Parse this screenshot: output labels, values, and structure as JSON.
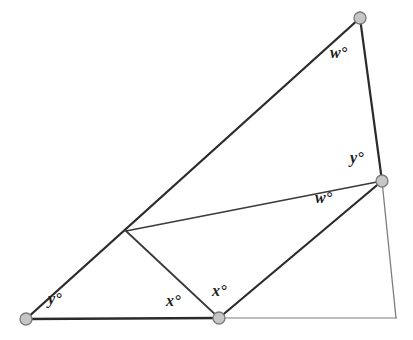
{
  "figure": {
    "width": 413,
    "height": 340,
    "background_color": "#ffffff",
    "stroke_color_primary": "#2b2b2b",
    "stroke_color_secondary": "#6f6f6f",
    "vertex_fill_color": "#c6c6c6",
    "vertex_stroke_color": "#7a7a7a",
    "label_color": "#1d1d1d"
  },
  "points": [
    {
      "id": "A",
      "name": "bottom-left-vertex",
      "x": 26,
      "y": 319,
      "marker": "dot"
    },
    {
      "id": "B",
      "name": "bottom-middle-vertex",
      "x": 219,
      "y": 318,
      "marker": "dot"
    },
    {
      "id": "C",
      "name": "right-middle-vertex",
      "x": 382,
      "y": 181,
      "marker": "dot"
    },
    {
      "id": "D",
      "name": "top-right-vertex",
      "x": 360,
      "y": 18,
      "marker": "dot"
    },
    {
      "id": "E",
      "name": "interior-junction-point",
      "x": 126,
      "y": 231,
      "marker": "none"
    },
    {
      "id": "F",
      "name": "bottom-right-corner",
      "x": 396,
      "y": 318,
      "marker": "none"
    }
  ],
  "segments": [
    {
      "id": "AD",
      "name": "long-left-diagonal",
      "from": "A",
      "to": "D",
      "weight": "heavy"
    },
    {
      "id": "AB",
      "name": "bottom-left-baseline",
      "from": "A",
      "to": "B",
      "weight": "heavy"
    },
    {
      "id": "DC",
      "name": "right-upper-edge",
      "from": "D",
      "to": "C",
      "weight": "heavy"
    },
    {
      "id": "BC",
      "name": "inner-right-diagonal",
      "from": "B",
      "to": "C",
      "weight": "heavy"
    },
    {
      "id": "BE",
      "name": "inner-left-diagonal",
      "from": "B",
      "to": "E",
      "weight": "light"
    },
    {
      "id": "EC",
      "name": "inner-horizontal-chord",
      "from": "E",
      "to": "C",
      "weight": "light"
    },
    {
      "id": "BF",
      "name": "bottom-right-baseline",
      "from": "B",
      "to": "F",
      "weight": "faint"
    },
    {
      "id": "CF",
      "name": "right-lower-edge",
      "from": "C",
      "to": "F",
      "weight": "faint"
    }
  ],
  "labels": [
    {
      "id": "L1",
      "name": "angle-label-y-bottom-left",
      "text": "y°",
      "x": 48,
      "y": 291,
      "variable": "y"
    },
    {
      "id": "L2",
      "name": "angle-label-x-left-of-b",
      "text": "x°",
      "x": 166,
      "y": 293,
      "variable": "x"
    },
    {
      "id": "L3",
      "name": "angle-label-x-right-of-b",
      "text": "x°",
      "x": 212,
      "y": 283,
      "variable": "x"
    },
    {
      "id": "L4",
      "name": "angle-label-w-top",
      "text": "w°",
      "x": 330,
      "y": 45,
      "variable": "w"
    },
    {
      "id": "L5",
      "name": "angle-label-y-at-c",
      "text": "y°",
      "x": 350,
      "y": 150,
      "variable": "y"
    },
    {
      "id": "L6",
      "name": "angle-label-w-at-c",
      "text": "w°",
      "x": 315,
      "y": 190,
      "variable": "w"
    }
  ]
}
